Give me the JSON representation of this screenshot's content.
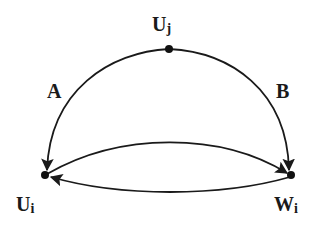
{
  "diagram": {
    "nodes": [
      {
        "id": "Uj",
        "label": "U",
        "subscript": "j",
        "x": 169,
        "y": 49
      },
      {
        "id": "Ui",
        "label": "U",
        "subscript": "i",
        "x": 45,
        "y": 175
      },
      {
        "id": "Wi",
        "label": "W",
        "subscript": "i",
        "x": 291,
        "y": 175
      }
    ],
    "edges": [
      {
        "from": "Uj",
        "to": "Ui",
        "label": "A"
      },
      {
        "from": "Uj",
        "to": "Wi",
        "label": "B"
      },
      {
        "from": "Ui",
        "to": "Wi",
        "label": ""
      },
      {
        "from": "Wi",
        "to": "Ui",
        "label": ""
      }
    ],
    "edge_labels": {
      "A": "A",
      "B": "B"
    },
    "colors": {
      "stroke": "#1a1a1a",
      "background": "#ffffff"
    }
  }
}
